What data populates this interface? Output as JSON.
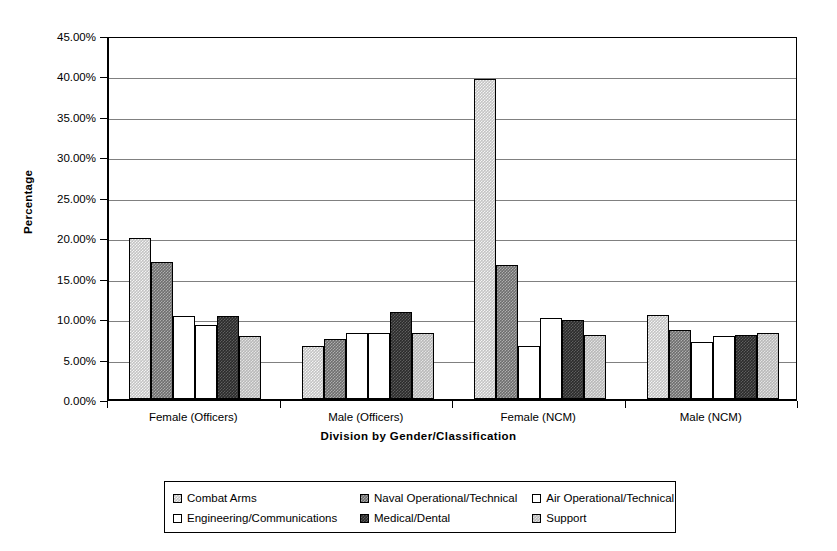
{
  "chart_data": {
    "type": "bar",
    "title": "",
    "xlabel": "Division by Gender/Classification",
    "ylabel": "Percentage",
    "ylim": [
      0,
      45
    ],
    "ytick_step": 5,
    "ytick_labels": [
      "45.00%",
      "40.00%",
      "35.00%",
      "30.00%",
      "25.00%",
      "20.00%",
      "15.00%",
      "10.00%",
      "5.00%",
      "0.00%"
    ],
    "ytick_values": [
      45,
      40,
      35,
      30,
      25,
      20,
      15,
      10,
      5,
      0
    ],
    "grid": true,
    "legend_position": "bottom",
    "categories": [
      "Female (Officers)",
      "Male (Officers)",
      "Female (NCM)",
      "Male (NCM)"
    ],
    "series": [
      {
        "name": "Combat Arms",
        "key": "combat",
        "values": [
          19.9,
          6.6,
          39.6,
          10.4
        ]
      },
      {
        "name": "Naval Operational/Technical",
        "key": "naval",
        "values": [
          16.9,
          7.4,
          16.6,
          8.5
        ]
      },
      {
        "name": "Air Operational/Technical",
        "key": "air",
        "values": [
          10.3,
          8.2,
          6.5,
          7.0
        ]
      },
      {
        "name": "Engineering/Communications",
        "key": "eng",
        "values": [
          9.2,
          8.2,
          10.0,
          7.8
        ]
      },
      {
        "name": "Medical/Dental",
        "key": "medical",
        "values": [
          10.3,
          10.7,
          9.8,
          7.9
        ]
      },
      {
        "name": "Support",
        "key": "support",
        "values": [
          7.8,
          8.1,
          7.9,
          8.1
        ]
      }
    ]
  },
  "legend": {
    "rows": [
      [
        {
          "label": "Combat Arms",
          "key": "combat"
        },
        {
          "label": "Naval Operational/Technical",
          "key": "naval"
        },
        {
          "label": "Air Operational/Technical",
          "key": "air"
        }
      ],
      [
        {
          "label": "Engineering/Communications",
          "key": "eng"
        },
        {
          "label": "Medical/Dental",
          "key": "medical"
        },
        {
          "label": "Support",
          "key": "support"
        }
      ]
    ]
  },
  "colors": {
    "combat": "#c3c3c3",
    "naval": "#6e6e6e",
    "air": "#ffffff",
    "eng": "#ffffff",
    "medical": "#2b2b2b",
    "support": "#b8b8b8",
    "axis": "#000000",
    "grid": "#808080",
    "background": "#ffffff"
  }
}
